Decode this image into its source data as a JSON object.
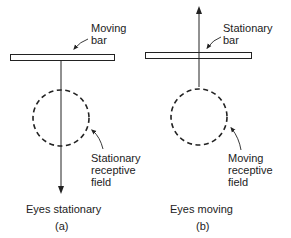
{
  "panel_a": {
    "bar_label_1": "Moving",
    "bar_label_2": "bar",
    "field_label_1": "Stationary",
    "field_label_2": "receptive",
    "field_label_3": "field",
    "caption": "Eyes stationary",
    "letter": "(a)"
  },
  "panel_b": {
    "bar_label_1": "Stationary",
    "bar_label_2": "bar",
    "field_label_1": "Moving",
    "field_label_2": "receptive",
    "field_label_3": "field",
    "caption": "Eyes moving",
    "letter": "(b)"
  },
  "colors": {
    "ink": "#222222",
    "background": "#ffffff"
  }
}
